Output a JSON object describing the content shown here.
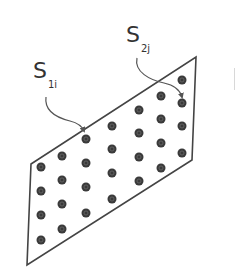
{
  "figure": {
    "width": 236,
    "height": 279,
    "colors": {
      "outline": "#444444",
      "dot_fill": "#3a3a3a",
      "dot_inner": "#6a6a6a",
      "arrow": "#555555",
      "label": "#333333"
    },
    "panel": {
      "shape": "parallelogram",
      "corners": [
        [
          31,
          164
        ],
        [
          196,
          57
        ],
        [
          192,
          160
        ],
        [
          27,
          265
        ]
      ]
    },
    "dots": {
      "columns": 7,
      "rows": 4,
      "positions": [
        [
          41,
          167
        ],
        [
          41,
          191
        ],
        [
          41,
          215
        ],
        [
          41,
          240
        ],
        [
          62,
          156
        ],
        [
          62,
          180
        ],
        [
          62,
          204
        ],
        [
          62,
          229
        ],
        [
          86,
          139
        ],
        [
          86,
          163
        ],
        [
          86,
          187
        ],
        [
          86,
          213
        ],
        [
          112,
          126
        ],
        [
          112,
          149
        ],
        [
          112,
          173
        ],
        [
          112,
          199
        ],
        [
          139,
          110
        ],
        [
          139,
          133
        ],
        [
          139,
          157
        ],
        [
          139,
          181
        ],
        [
          161,
          96
        ],
        [
          161,
          119
        ],
        [
          161,
          143
        ],
        [
          161,
          168
        ],
        [
          182,
          80
        ],
        [
          182,
          103
        ],
        [
          182,
          126
        ],
        [
          182,
          153
        ]
      ],
      "radius": 4.5
    },
    "labels": [
      {
        "id": "s1i",
        "main": "S",
        "sub": "1i",
        "x": 33,
        "y": 60
      },
      {
        "id": "s2j",
        "main": "S",
        "sub": "2j",
        "x": 126,
        "y": 24
      }
    ],
    "arrows": [
      {
        "id": "arrow-s1i",
        "path": "M46,97 C44,112 58,118 70,121 C78,123 82,126 84,131"
      },
      {
        "id": "arrow-s2j",
        "path": "M137,58 C134,72 150,80 164,83 C174,85 180,90 182,97"
      }
    ]
  }
}
